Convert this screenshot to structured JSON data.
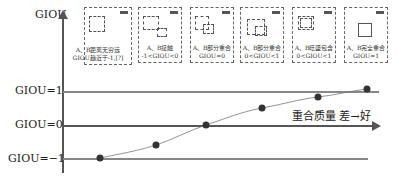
{
  "y_axis": {
    "title": "GIOU",
    "levels": [
      {
        "label": "GIOU=1",
        "value": 1
      },
      {
        "label": "GIOU=0",
        "value": 0
      },
      {
        "label": "GIOU=−1",
        "value": -1
      }
    ]
  },
  "x_axis": {
    "label": "重合质量 差→好"
  },
  "cases": [
    {
      "line1": "A、B距离无穷远",
      "line2": "GIOU趋近于-1,[?]",
      "corner_tag": "预测"
    },
    {
      "line1": "A、B接触",
      "line2": "-1<GIOU<0",
      "corner_tag": "预测"
    },
    {
      "line1": "A、B部分重合",
      "line2": "GIOU=0",
      "corner_tag": "预测"
    },
    {
      "line1": "A、B部分重合",
      "line2": "0<GIOU<1",
      "corner_tag": "预测"
    },
    {
      "line1": "A、B旺盛包含",
      "line2": "0<GIOU<1",
      "corner_tag": "预测"
    },
    {
      "line1": "A、B完全重合",
      "line2": "GIOU=1",
      "corner_tag": "预测"
    }
  ],
  "curve_points": [
    {
      "x": 100,
      "y": 158
    },
    {
      "x": 156,
      "y": 145
    },
    {
      "x": 206,
      "y": 125
    },
    {
      "x": 262,
      "y": 108
    },
    {
      "x": 318,
      "y": 97
    },
    {
      "x": 367,
      "y": 89
    }
  ],
  "colors": {
    "axis": "#555555",
    "grid": "#888888",
    "point": "#333333",
    "curve": "#777777"
  }
}
